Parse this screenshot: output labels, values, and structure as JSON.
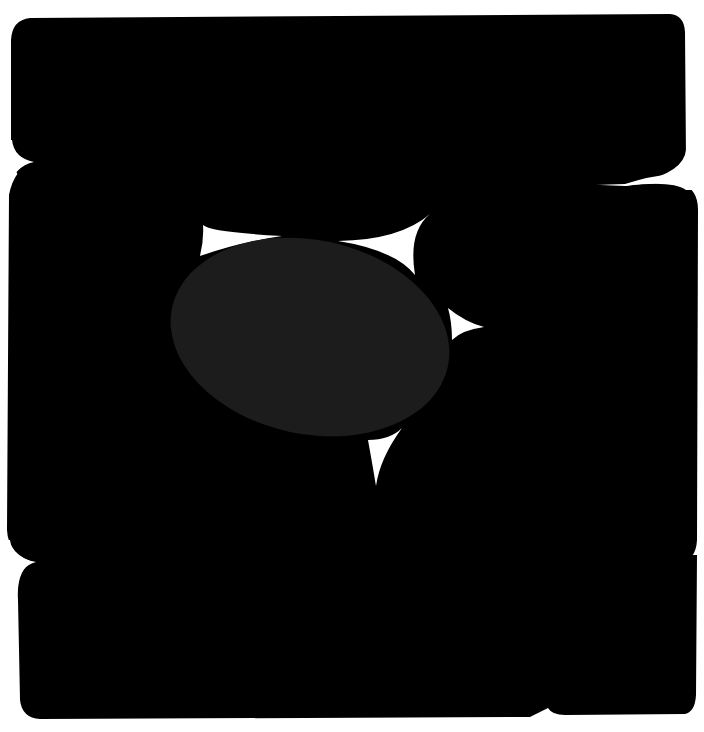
{
  "artwork": {
    "background_color": "#ffffff",
    "block_color": "#000000",
    "ellipse_color": "#1c1c1c",
    "spike_color": "#ffffff",
    "shapes": {
      "top_slab": "black rounded slab",
      "middle_block": "black rounded block",
      "bottom_slab": "black rounded slab",
      "center_ellipse": "dark gray ellipse",
      "spikes": [
        "upper-left spike",
        "upper-right spike",
        "right spike",
        "lower spike"
      ]
    }
  }
}
